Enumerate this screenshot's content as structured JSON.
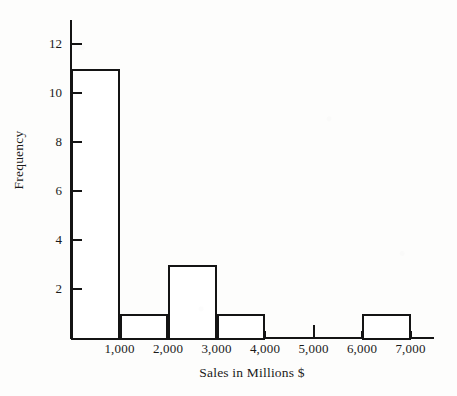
{
  "chart_data": {
    "type": "bar",
    "title": "",
    "subtitle": "",
    "xlabel": "Sales in Millions $",
    "ylabel": "Frequency",
    "categories": [
      "0-1,000",
      "1,000-2,000",
      "2,000-3,000",
      "3,000-4,000",
      "4,000-5,000",
      "5,000-6,000",
      "6,000-7,000"
    ],
    "bin_edges": [
      0,
      1000,
      2000,
      3000,
      4000,
      5000,
      6000,
      7000
    ],
    "values": [
      11,
      1,
      3,
      1,
      0,
      0,
      1
    ],
    "bars": [
      {
        "bin_start": 0,
        "bin_end": 1000,
        "frequency": 11
      },
      {
        "bin_start": 1000,
        "bin_end": 2000,
        "frequency": 1
      },
      {
        "bin_start": 2000,
        "bin_end": 3000,
        "frequency": 3
      },
      {
        "bin_start": 3000,
        "bin_end": 4000,
        "frequency": 1
      },
      {
        "bin_start": 4000,
        "bin_end": 5000,
        "frequency": 0
      },
      {
        "bin_start": 5000,
        "bin_end": 6000,
        "frequency": 0
      },
      {
        "bin_start": 6000,
        "bin_end": 7000,
        "frequency": 1
      }
    ],
    "x_ticks": [
      "1,000",
      "2,000",
      "3,000",
      "4,000",
      "5,000",
      "6,000",
      "7,000"
    ],
    "x_tick_values": [
      1000,
      2000,
      3000,
      4000,
      5000,
      6000,
      7000
    ],
    "y_ticks": [
      "2",
      "4",
      "6",
      "8",
      "10",
      "12"
    ],
    "y_tick_values": [
      2,
      4,
      6,
      8,
      10,
      12
    ],
    "xlim": [
      0,
      7500
    ],
    "ylim": [
      0,
      13
    ],
    "grid": false,
    "legend": false,
    "bar_fill_color": "#ffffff",
    "bar_edge_color": "#141414",
    "axis_color": "#141414"
  }
}
